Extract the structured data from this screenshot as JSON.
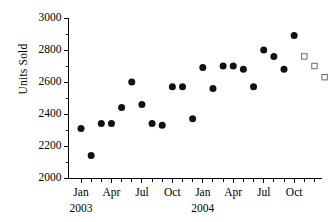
{
  "chart_data": {
    "type": "scatter",
    "title": "",
    "xlabel": "",
    "ylabel": "Units Sold",
    "ylim": [
      2000,
      3000
    ],
    "ytick_labels": [
      "2000",
      "2200",
      "2400",
      "2600",
      "2800",
      "3000"
    ],
    "ytick_values": [
      2000,
      2200,
      2400,
      2600,
      2800,
      3000
    ],
    "y_minor_tick_step": 100,
    "grid": false,
    "legend": null,
    "xlim_months": [
      0,
      24
    ],
    "x_axis_ticks_are_monthly": true,
    "xtick_labels": [
      "Jan",
      "Apr",
      "Jul",
      "Oct",
      "Jan",
      "Apr",
      "Jul",
      "Oct"
    ],
    "xtick_month_index": [
      0,
      3,
      6,
      9,
      12,
      15,
      18,
      21
    ],
    "year_labels": [
      "2003",
      "2004"
    ],
    "year_label_month_index": [
      0,
      12
    ],
    "series": [
      {
        "name": "Actual",
        "marker": "filled-circle",
        "color": "#111111",
        "x": [
          0,
          1,
          2,
          3,
          4,
          5,
          6,
          7,
          8,
          9,
          10,
          11,
          12,
          13,
          14,
          15,
          16,
          17,
          18,
          19,
          20,
          21
        ],
        "values": [
          2310,
          2140,
          2340,
          2340,
          2440,
          2600,
          2460,
          2340,
          2330,
          2570,
          2570,
          2370,
          2690,
          2560,
          2700,
          2700,
          2680,
          2570,
          2800,
          2760,
          2680,
          2890
        ]
      },
      {
        "name": "Forecast",
        "marker": "open-square",
        "color": "#6b6b6b",
        "x": [
          22,
          23,
          24
        ],
        "values": [
          2760,
          2700,
          2630
        ]
      }
    ]
  }
}
